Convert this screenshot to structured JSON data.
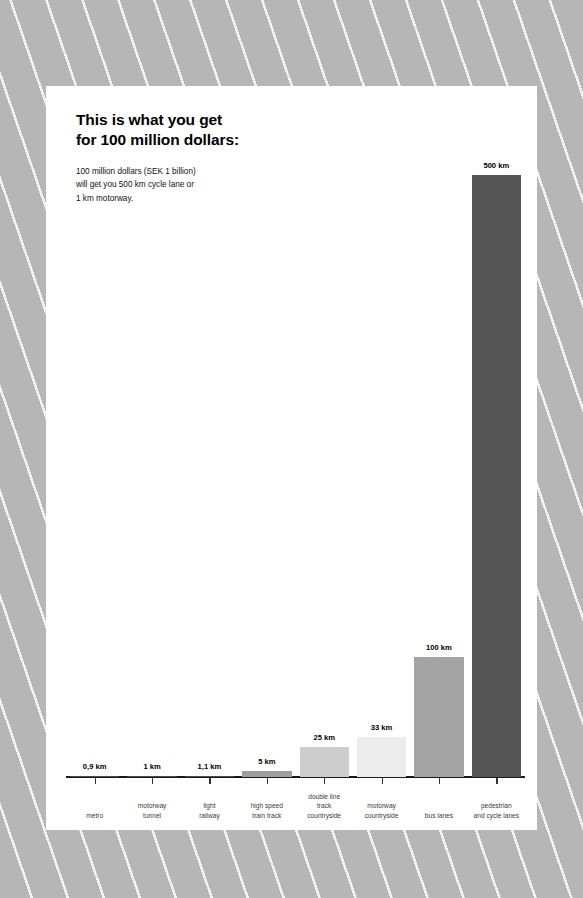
{
  "title": "This is what you get\nfor 100 million dollars:",
  "subtitle": "100 million dollars (SEK 1 billion)\nwill get you 500 km cycle lane or\n1 km motorway.",
  "chart_data": {
    "type": "bar",
    "title": "This is what you get for 100 million dollars:",
    "subtitle": "100 million dollars (SEK 1 billion) will get you 500 km cycle lane or 1 km motorway.",
    "xlabel": "",
    "ylabel": "",
    "unit": "km",
    "ylim": [
      0,
      500
    ],
    "grid": false,
    "legend": false,
    "categories": [
      "metro",
      "motorway\ntunnel",
      "light\nrailway",
      "high speed\ntrain track",
      "double line\ntrack\ncountryside",
      "motorway\ncountryside",
      "bus lanes",
      "pedestrian\nand cycle lanes"
    ],
    "values": [
      0.9,
      1,
      1.1,
      5,
      25,
      33,
      100,
      500
    ],
    "value_labels": [
      "0,9 km",
      "1 km",
      "1,1 km",
      "5 km",
      "25 km",
      "33 km",
      "100 km",
      "500 km"
    ],
    "bar_colors": [
      "#4a4a4a",
      "#4a4a4a",
      "#4a4a4a",
      "#9e9e9e",
      "#cdcdcd",
      "#ececec",
      "#a3a3a3",
      "#555555"
    ]
  },
  "colors": {
    "background": "#b6b6b6",
    "stripe": "#f2f2f2",
    "card": "#ffffff",
    "axis": "#1a1a1a",
    "value_text": "#000000",
    "category_text": "#3a3a3a"
  }
}
